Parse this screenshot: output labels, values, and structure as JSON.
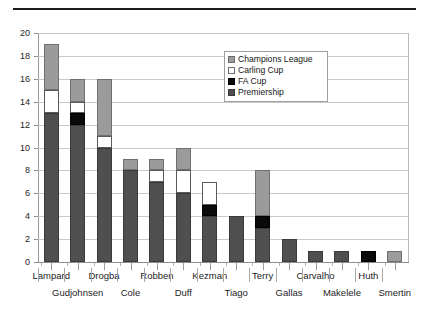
{
  "chart_data": {
    "type": "bar",
    "stacked": true,
    "title": "",
    "xlabel": "",
    "ylabel": "",
    "ylim": [
      0,
      20
    ],
    "ytick_step": 2,
    "yticks": [
      0,
      2,
      4,
      6,
      8,
      10,
      12,
      14,
      16,
      18,
      20
    ],
    "grid": true,
    "legend_position": "inside-top-right",
    "categories": [
      "Lampard",
      "Gudjohnsen",
      "Drogba",
      "Cole",
      "Robben",
      "Duff",
      "Kezman",
      "Tiago",
      "Terry",
      "Gallas",
      "Carvalho",
      "Makelele",
      "Huth",
      "Smertin"
    ],
    "series": [
      {
        "name": "Premiership",
        "color": "#4f4f4f",
        "values": [
          13,
          12,
          10,
          8,
          7,
          6,
          4,
          4,
          3,
          2,
          1,
          1,
          0,
          0
        ]
      },
      {
        "name": "FA Cup",
        "color": "#0a0a0a",
        "values": [
          0,
          1,
          0,
          0,
          0,
          0,
          1,
          0,
          1,
          0,
          0,
          0,
          1,
          0
        ]
      },
      {
        "name": "Carling Cup",
        "color": "#ffffff",
        "values": [
          2,
          1,
          1,
          0,
          1,
          2,
          2,
          0,
          0,
          0,
          0,
          0,
          0,
          0
        ]
      },
      {
        "name": "Champions League",
        "color": "#9b9b9b",
        "values": [
          4,
          2,
          5,
          1,
          1,
          2,
          0,
          0,
          4,
          0,
          0,
          0,
          0,
          1
        ]
      }
    ],
    "totals": [
      19,
      16,
      16,
      9,
      9,
      10,
      7,
      4,
      8,
      2,
      1,
      1,
      1,
      1
    ]
  },
  "legend": {
    "items": [
      {
        "label": "Champions League",
        "swatch": "champions"
      },
      {
        "label": "Carling Cup",
        "swatch": "carling"
      },
      {
        "label": "FA Cup",
        "swatch": "facup"
      },
      {
        "label": "Premiership",
        "swatch": "premiership"
      }
    ]
  },
  "axis": {
    "y_labels": [
      "20",
      "18",
      "16",
      "14",
      "12",
      "10",
      "8",
      "6",
      "4",
      "2",
      "0"
    ],
    "x_labels_row0": [
      "Lampard",
      "Drogba",
      "Robben",
      "Kezman",
      "Terry",
      "Carvalho",
      "Huth"
    ],
    "x_labels_row1": [
      "Gudjohnsen",
      "Cole",
      "Duff",
      "Tiago",
      "Gallas",
      "Makelele",
      "Smertin"
    ]
  }
}
